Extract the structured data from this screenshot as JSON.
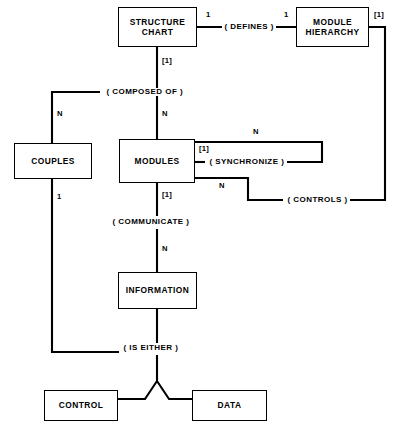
{
  "diagram": {
    "stroke_color": "#000000",
    "background_color": "#ffffff",
    "entities": [
      {
        "id": "structure-chart",
        "label": "STRUCTURE\nCHART",
        "line1": "STRUCTURE",
        "line2": "CHART",
        "x": 118,
        "y": 7,
        "w": 79,
        "h": 40
      },
      {
        "id": "module-hierarchy",
        "label": "MODULE\nHIERARCHY",
        "line1": "MODULE",
        "line2": "HIERARCHY",
        "x": 296,
        "y": 7,
        "w": 73,
        "h": 40
      },
      {
        "id": "couples",
        "label": "COUPLES",
        "line1": "COUPLES",
        "line2": "",
        "x": 14,
        "y": 143,
        "w": 78,
        "h": 36
      },
      {
        "id": "modules",
        "label": "MODULES",
        "line1": "MODULES",
        "line2": "",
        "x": 119,
        "y": 139,
        "w": 76,
        "h": 44
      },
      {
        "id": "information",
        "label": "INFORMATION",
        "line1": "INFORMATION",
        "line2": "",
        "x": 118,
        "y": 272,
        "w": 79,
        "h": 37
      },
      {
        "id": "control",
        "label": "CONTROL",
        "line1": "CONTROL",
        "line2": "",
        "x": 44,
        "y": 390,
        "w": 74,
        "h": 31
      },
      {
        "id": "data",
        "label": "DATA",
        "line1": "DATA",
        "line2": "",
        "x": 192,
        "y": 390,
        "w": 75,
        "h": 31
      }
    ],
    "relationships": [
      {
        "id": "defines",
        "label": "( DEFINES )",
        "x": 222,
        "y": 23
      },
      {
        "id": "composed-of",
        "label": "( COMPOSED OF )",
        "x": 104,
        "y": 88
      },
      {
        "id": "synchronize",
        "label": "( SYNCHRONIZE )",
        "x": 213,
        "y": 158
      },
      {
        "id": "controls",
        "label": "( CONTROLS )",
        "x": 289,
        "y": 196
      },
      {
        "id": "communicate",
        "label": "( COMMUNICATE )",
        "x": 110,
        "y": 222
      },
      {
        "id": "is-either",
        "label": "( IS EITHER )",
        "x": 122,
        "y": 348
      }
    ],
    "cardinalities": [
      {
        "id": "card-defines-left",
        "label": "1",
        "x": 205,
        "y": 11
      },
      {
        "id": "card-defines-right",
        "label": "1",
        "x": 283,
        "y": 11
      },
      {
        "id": "card-hierarchy-right",
        "label": "[1]",
        "x": 375,
        "y": 11
      },
      {
        "id": "card-structure-down",
        "label": "[1]",
        "x": 161,
        "y": 62
      },
      {
        "id": "card-couples-n",
        "label": "N",
        "x": 56,
        "y": 113
      },
      {
        "id": "card-modules-n",
        "label": "N",
        "x": 161,
        "y": 113
      },
      {
        "id": "card-sync-left",
        "label": "[1]",
        "x": 198,
        "y": 145
      },
      {
        "id": "card-sync-n",
        "label": "N",
        "x": 252,
        "y": 131
      },
      {
        "id": "card-controls-n",
        "label": "N",
        "x": 218,
        "y": 183
      },
      {
        "id": "card-couples-1",
        "label": "1",
        "x": 56,
        "y": 196
      },
      {
        "id": "card-communicate-1",
        "label": "[1]",
        "x": 161,
        "y": 196
      },
      {
        "id": "card-information-n",
        "label": "N",
        "x": 161,
        "y": 248
      }
    ]
  }
}
